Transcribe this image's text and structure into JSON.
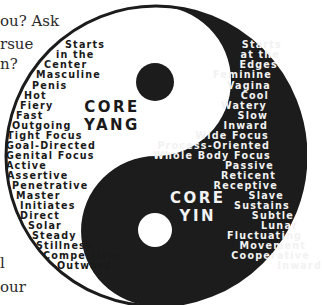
{
  "colors": {
    "black": "#1c1c1c",
    "white": "#ffffff",
    "yin_text": "#f2f2f2",
    "yang_text": "#1a1a1a"
  },
  "page_fragments": [
    {
      "text": "ou? Ask",
      "x": 0,
      "y": 14
    },
    {
      "text": "rsue",
      "x": 0,
      "y": 37
    },
    {
      "text": "n?",
      "x": 0,
      "y": 57
    },
    {
      "text": "l",
      "x": 0,
      "y": 256
    },
    {
      "text": "our",
      "x": 0,
      "y": 280
    }
  ],
  "yang": {
    "title_line1": "CORE",
    "title_line2": "YANG",
    "items": [
      {
        "text": "Starts",
        "x": 65,
        "y": 40
      },
      {
        "text": "in the",
        "x": 56,
        "y": 50
      },
      {
        "text": "Center",
        "x": 44,
        "y": 60
      },
      {
        "text": "Masculine",
        "x": 36,
        "y": 70
      },
      {
        "text": "Penis",
        "x": 32,
        "y": 81
      },
      {
        "text": "Hot",
        "x": 24,
        "y": 91
      },
      {
        "text": "Fiery",
        "x": 20,
        "y": 101
      },
      {
        "text": "Fast",
        "x": 16,
        "y": 111
      },
      {
        "text": "Outgoing",
        "x": 12,
        "y": 121
      },
      {
        "text": "Tight Focus",
        "x": 7,
        "y": 131
      },
      {
        "text": "Goal-Directed",
        "x": 6,
        "y": 141
      },
      {
        "text": "Genital Focus",
        "x": 6,
        "y": 151
      },
      {
        "text": "Active",
        "x": 6,
        "y": 161
      },
      {
        "text": "Assertive",
        "x": 7,
        "y": 171
      },
      {
        "text": "Penetrative",
        "x": 12,
        "y": 181
      },
      {
        "text": "Master",
        "x": 16,
        "y": 191
      },
      {
        "text": "Initiates",
        "x": 20,
        "y": 201
      },
      {
        "text": "Direct",
        "x": 20,
        "y": 211
      },
      {
        "text": "Solar",
        "x": 28,
        "y": 221
      },
      {
        "text": "Steady",
        "x": 32,
        "y": 231
      },
      {
        "text": "Stillness",
        "x": 36,
        "y": 241
      },
      {
        "text": "Competitive",
        "x": 43,
        "y": 251
      },
      {
        "text": "Outward",
        "x": 57,
        "y": 261
      }
    ]
  },
  "yin": {
    "title_line1": "CORE",
    "title_line2": "YIN",
    "items": [
      {
        "text": "Starts",
        "right": 242,
        "y": 40
      },
      {
        "text": "at the",
        "right": 240,
        "y": 50
      },
      {
        "text": "Edges",
        "right": 238,
        "y": 60
      },
      {
        "text": "Feminine",
        "right": 232,
        "y": 70
      },
      {
        "text": "Vagina",
        "right": 231,
        "y": 81
      },
      {
        "text": "Cool",
        "right": 229,
        "y": 91
      },
      {
        "text": "Watery",
        "right": 227,
        "y": 101
      },
      {
        "text": "Slow",
        "right": 228,
        "y": 111
      },
      {
        "text": "Inward",
        "right": 228,
        "y": 121
      },
      {
        "text": "Wide Focus",
        "right": 229,
        "y": 131
      },
      {
        "text": "Process-Oriented",
        "right": 230,
        "y": 141
      },
      {
        "text": "Whole Body Focus",
        "right": 231,
        "y": 151
      },
      {
        "text": "Passive",
        "right": 234,
        "y": 161
      },
      {
        "text": "Reticent",
        "right": 236,
        "y": 171
      },
      {
        "text": "Receptive",
        "right": 238,
        "y": 181
      },
      {
        "text": "Slave",
        "right": 244,
        "y": 191
      },
      {
        "text": "Sustains",
        "right": 250,
        "y": 201
      },
      {
        "text": "Subtle",
        "right": 254,
        "y": 211
      },
      {
        "text": "Lunar",
        "right": 258,
        "y": 221
      },
      {
        "text": "Fluctuating",
        "right": 262,
        "y": 231
      },
      {
        "text": "Movement",
        "right": 266,
        "y": 241
      },
      {
        "text": "Cooperative",
        "right": 270,
        "y": 251
      },
      {
        "text": "Inward",
        "right": 282,
        "y": 261
      }
    ]
  }
}
